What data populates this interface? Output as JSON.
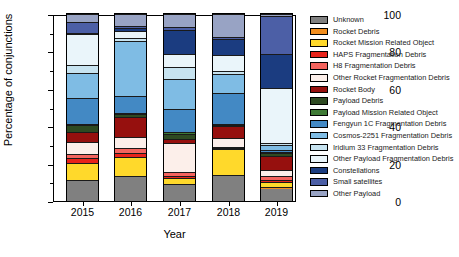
{
  "chart_data": {
    "type": "bar",
    "stacked": true,
    "stack_normalized": true,
    "title": "",
    "xlabel": "Year",
    "ylabel": "Percentage of conjunctions",
    "categories": [
      "2015",
      "2016",
      "2017",
      "2018",
      "2019"
    ],
    "ylim": [
      0,
      100
    ],
    "yticks": [
      0,
      20,
      40,
      60,
      80,
      100
    ],
    "ytick_labels": [
      "0",
      "20",
      "40",
      "60",
      "80",
      "100"
    ],
    "grid": false,
    "legend_position": "right",
    "series": [
      {
        "name": "Unknown",
        "color": "#808080",
        "values": [
          10.5,
          11.5,
          8.5,
          13.5,
          6.5
        ]
      },
      {
        "name": "Rocket Debris",
        "color": "#F28E1E",
        "values": [
          1.0,
          0.6,
          0.5,
          0.3,
          1.2
        ]
      },
      {
        "name": "Rocket Mission Related Object",
        "color": "#FFD92B",
        "values": [
          9.0,
          9.3,
          3.5,
          14.2,
          2.3
        ]
      },
      {
        "name": "HAPS Fragmentation Debris",
        "color": "#E8231A",
        "values": [
          2.5,
          1.6,
          1.0,
          0.5,
          1.0
        ]
      },
      {
        "name": "H8 Fragmentation Debris",
        "color": "#F4645E",
        "values": [
          2.0,
          2.6,
          2.0,
          0.5,
          2.5
        ]
      },
      {
        "name": "Other Rocket Fragmentation Debris",
        "color": "#FCEFEA",
        "values": [
          6.5,
          5.5,
          15.5,
          4.5,
          3.0
        ]
      },
      {
        "name": "Rocket Body",
        "color": "#96100E",
        "values": [
          5.5,
          9.5,
          2.0,
          6.5,
          7.5
        ]
      },
      {
        "name": "Payload Debris",
        "color": "#2E4A22",
        "values": [
          3.5,
          1.3,
          3.0,
          0.5,
          1.5
        ]
      },
      {
        "name": "Payload Mission Related Object",
        "color": "#3E7A35",
        "values": [
          0.5,
          0.6,
          1.0,
          0.3,
          0.5
        ]
      },
      {
        "name": "Fengyun 1C Fragmentation Debris",
        "color": "#4389C4",
        "values": [
          14.0,
          8.0,
          12.0,
          17.0,
          1.5
        ]
      },
      {
        "name": "Cosmos-2251 Fragmentation Debris",
        "color": "#7FBCE4",
        "values": [
          13.5,
          26.5,
          16.0,
          10.5,
          2.5
        ]
      },
      {
        "name": "Iridium 33 Fragmentation Debris",
        "color": "#C7E3F0",
        "values": [
          4.5,
          1.8,
          6.5,
          1.5,
          1.0
        ]
      },
      {
        "name": "Other Payload Fragmentation Debris",
        "color": "#EAF5FA",
        "values": [
          16.5,
          3.0,
          7.0,
          8.5,
          29.5
        ]
      },
      {
        "name": "Constellations",
        "color": "#1B3C80",
        "values": [
          0.5,
          1.5,
          13.0,
          8.5,
          18.0
        ]
      },
      {
        "name": "Small satellites",
        "color": "#4C5FA6",
        "values": [
          5.5,
          1.0,
          1.5,
          1.5,
          20.5
        ]
      },
      {
        "name": "Other Payload",
        "color": "#98A3C4",
        "values": [
          4.5,
          5.8,
          7.0,
          12.2,
          1.0
        ]
      }
    ]
  },
  "axes": {
    "y_label": "Percentage of conjunctions",
    "x_label": "Year"
  }
}
